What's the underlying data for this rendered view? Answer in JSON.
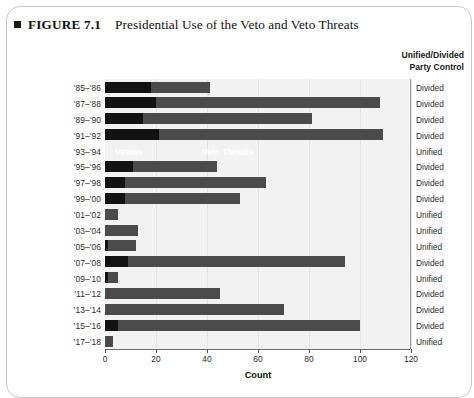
{
  "figure": {
    "label": "FIGURE 7.1",
    "caption": "Presidential Use of the Veto and Veto Threats",
    "bullet_icon": "square-bullet-icon"
  },
  "right_header": {
    "line1": "Unified/Divided",
    "line2": "Party Control"
  },
  "annotations": {
    "vetoes": "Vetoes",
    "veto_threats": "Veto Threats"
  },
  "colors": {
    "vetoes": "#121212",
    "veto_threats": "#4b4b4b",
    "plot_background": "#f2f2f2",
    "gridline": "#e3e3e3",
    "axis": "#6f6f6f"
  },
  "chart_data": {
    "type": "bar",
    "orientation": "horizontal",
    "stacked": true,
    "title": "Presidential Use of the Veto and Veto Threats",
    "xlabel": "Count",
    "ylabel": "",
    "xlim": [
      0,
      120
    ],
    "xticks": [
      0,
      20,
      40,
      60,
      80,
      100,
      120
    ],
    "grid": true,
    "legend_position": "in-plot",
    "categories": [
      "'85–'86",
      "'87–'88",
      "'89–'90",
      "'91–'92",
      "'93–'94",
      "'95–'96",
      "'97–'98",
      "'99–'00",
      "'01–'02",
      "'03–'04",
      "'05–'06",
      "'07–'08",
      "'09–'10",
      "'11–'12",
      "'13–'14",
      "'15–'16",
      "'17–'18"
    ],
    "series": [
      {
        "name": "Vetoes",
        "values": [
          18,
          20,
          15,
          21,
          0,
          11,
          8,
          8,
          0,
          0,
          1,
          9,
          1,
          0,
          0,
          5,
          0
        ]
      },
      {
        "name": "Veto Threats",
        "values": [
          23,
          88,
          66,
          88,
          0,
          33,
          55,
          45,
          5,
          13,
          11,
          85,
          4,
          45,
          70,
          95,
          3
        ]
      }
    ],
    "totals": [
      41,
      108,
      81,
      109,
      0,
      44,
      63,
      53,
      5,
      13,
      12,
      94,
      5,
      45,
      70,
      100,
      3
    ],
    "annotations": [
      {
        "text": "Vetoes",
        "row": 4,
        "x": 4
      },
      {
        "text": "Veto Threats",
        "row": 4,
        "x": 38
      }
    ],
    "party_control": [
      "Divided",
      "Divided",
      "Divided",
      "Divided",
      "Unified",
      "Divided",
      "Divided",
      "Divided",
      "Unified",
      "Unified",
      "Unified",
      "Divided",
      "Unified",
      "Divided",
      "Divided",
      "Divided",
      "Unified"
    ]
  }
}
